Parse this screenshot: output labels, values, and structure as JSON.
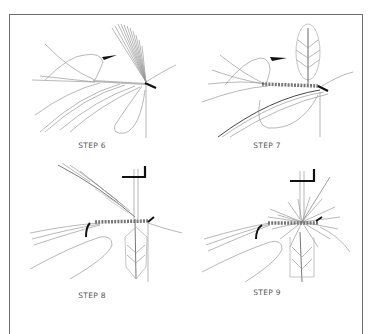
{
  "figure": {
    "title": "",
    "colors": {
      "frame": "#6e6e6e",
      "line": "#8a8a8a",
      "ink": "#111111",
      "label": "#555555"
    },
    "panels": [
      {
        "id": "step6",
        "label": "STEP 6"
      },
      {
        "id": "step7",
        "label": "STEP 7"
      },
      {
        "id": "step8",
        "label": "STEP 8"
      },
      {
        "id": "step9",
        "label": "STEP 9"
      }
    ]
  }
}
